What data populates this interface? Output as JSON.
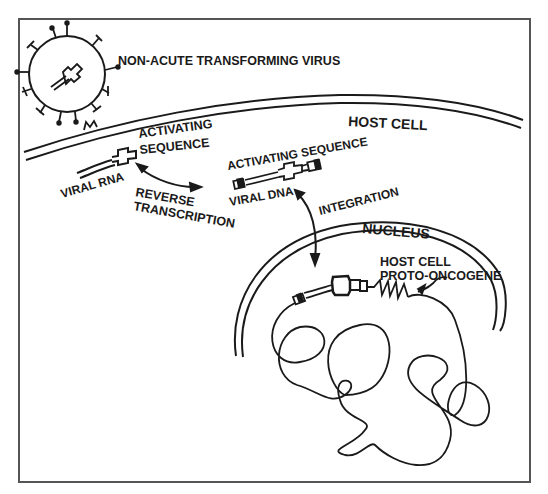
{
  "figure": {
    "border_color": "#555555",
    "ink_color": "#1a1a1a",
    "background": "#ffffff"
  },
  "labels": {
    "virus": "NON-ACUTE TRANSFORMING VIRUS",
    "host_cell": "HOST CELL",
    "activating_sequence_rna_line1": "ACTIVATING",
    "activating_sequence_rna_line2": "SEQUENCE",
    "viral_rna": "VIRAL RNA",
    "reverse_transcription_line1": "REVERSE",
    "reverse_transcription_line2": "TRANSCRIPTION",
    "activating_sequence_dna": "ACTIVATING SEQUENCE",
    "viral_dna": "VIRAL DNA",
    "integration": "INTEGRATION",
    "nucleus": "NUCLEUS",
    "proto_oncogene_line1": "HOST CELL",
    "proto_oncogene_line2": "PROTO-ONCOGENE"
  }
}
